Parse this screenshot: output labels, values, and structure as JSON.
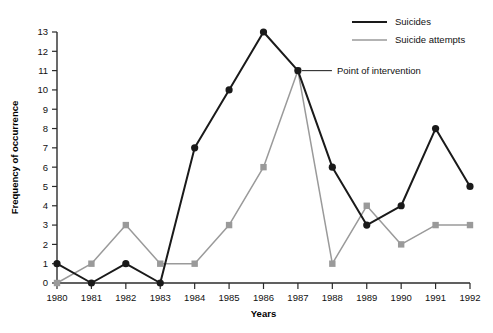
{
  "chart_data": {
    "type": "line",
    "title": "",
    "xlabel": "Years",
    "ylabel": "Frequency of occurrence",
    "categories": [
      1980,
      1981,
      1982,
      1983,
      1984,
      1985,
      1986,
      1987,
      1988,
      1989,
      1990,
      1991,
      1992
    ],
    "xtick_labels": [
      "1980",
      "1981",
      "1982",
      "1983",
      "1984",
      "1985",
      "1986",
      "1987",
      "1988",
      "1989",
      "1990",
      "1991",
      "1992"
    ],
    "ytick_labels": [
      "0",
      "1",
      "2",
      "3",
      "4",
      "5",
      "6",
      "7",
      "8",
      "9",
      "10",
      "11",
      "12",
      "13"
    ],
    "ylim": [
      0,
      13
    ],
    "xlim": [
      1980,
      1992
    ],
    "grid": false,
    "legend_position": "top-right",
    "series": [
      {
        "name": "Suicides",
        "color": "#1a1a1a",
        "marker": "circle",
        "values": [
          1,
          0,
          1,
          0,
          7,
          10,
          13,
          11,
          6,
          3,
          4,
          8,
          5
        ]
      },
      {
        "name": "Suicide attempts",
        "color": "#9a9a9a",
        "marker": "square",
        "values": [
          0,
          1,
          3,
          1,
          1,
          3,
          6,
          11,
          1,
          4,
          2,
          3,
          3
        ]
      }
    ],
    "annotations": [
      {
        "text": "Point of intervention",
        "x": 1987,
        "y": 11
      }
    ]
  },
  "legend": {
    "items": [
      {
        "label": "Suicides"
      },
      {
        "label": "Suicide attempts"
      }
    ]
  },
  "caption": {
    "text": ""
  }
}
